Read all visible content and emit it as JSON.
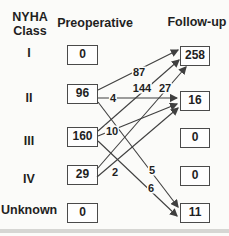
{
  "title": {
    "line1": "NYHA",
    "line2": "Class"
  },
  "columns": {
    "preop": "Preoperative",
    "followup": "Follow-up"
  },
  "rows": [
    {
      "class": "I",
      "preop": "0",
      "followup": "258"
    },
    {
      "class": "II",
      "preop": "96",
      "followup": "16"
    },
    {
      "class": "III",
      "preop": "160",
      "followup": "0"
    },
    {
      "class": "IV",
      "preop": "29",
      "followup": "0"
    },
    {
      "class": "Unknown",
      "preop": "0",
      "followup": "11"
    }
  ],
  "transitions": [
    {
      "from": "II",
      "to": "I",
      "value": "87"
    },
    {
      "from": "II",
      "to": "II",
      "value": "4"
    },
    {
      "from": "II",
      "to": "Unknown",
      "value": "5"
    },
    {
      "from": "III",
      "to": "I",
      "value": "144"
    },
    {
      "from": "III",
      "to": "II",
      "value": "10"
    },
    {
      "from": "III",
      "to": "Unknown",
      "value": "6"
    },
    {
      "from": "IV",
      "to": "I",
      "value": "27"
    },
    {
      "from": "IV",
      "to": "II",
      "value": "2"
    }
  ],
  "colors": {
    "line": "#3f3f3f",
    "text": "#1f1f1f",
    "box_border": "#4a4a4a",
    "background": "#fbfbf9"
  }
}
